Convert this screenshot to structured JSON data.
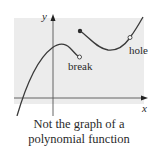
{
  "figure": {
    "axis_labels": {
      "x": "x",
      "y": "y"
    },
    "annotations": {
      "break": "break",
      "hole": "hole"
    },
    "colors": {
      "panel": "#ececec",
      "curve": "#3a3a3a",
      "axis": "#555555",
      "text": "#2a2a2a"
    }
  },
  "caption": {
    "line1": "Not the graph of a",
    "line2": "polynomial function"
  }
}
